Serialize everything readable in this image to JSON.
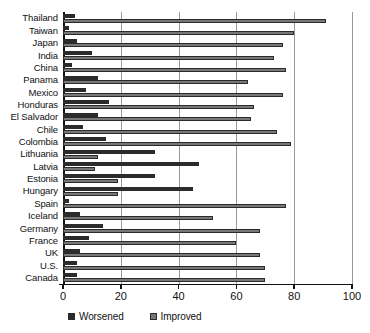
{
  "chart_data": {
    "type": "bar",
    "orientation": "horizontal",
    "title": "",
    "subtitle": "",
    "xlabel": "",
    "ylabel": "",
    "xlim": [
      0,
      100
    ],
    "xticks": [
      0,
      20,
      40,
      60,
      80,
      100
    ],
    "xtick_labels": [
      "0",
      "20",
      "40",
      "60",
      "80",
      "100"
    ],
    "grid": true,
    "grid_axis": "x",
    "legend_position": "bottom-left",
    "categories": [
      "Thailand",
      "Taiwan",
      "Japan",
      "India",
      "China",
      "Panama",
      "Mexico",
      "Honduras",
      "El Salvador",
      "Chile",
      "Colombia",
      "Lithuania",
      "Latvia",
      "Estonia",
      "Hungary",
      "Spain",
      "Iceland",
      "Germany",
      "France",
      "UK",
      "U.S.",
      "Canada"
    ],
    "series": [
      {
        "name": "Worsened",
        "color": "#2b2b2b",
        "values": [
          4,
          2,
          5,
          10,
          3,
          12,
          8,
          16,
          12,
          7,
          15,
          32,
          47,
          32,
          45,
          2,
          6,
          14,
          9,
          6,
          5,
          5
        ]
      },
      {
        "name": "Improved",
        "color": "#777777",
        "values": [
          91,
          80,
          76,
          73,
          77,
          64,
          76,
          66,
          65,
          74,
          79,
          12,
          11,
          19,
          19,
          77,
          52,
          68,
          60,
          68,
          70,
          70
        ]
      }
    ]
  },
  "legend": {
    "items": [
      {
        "label": "Worsened",
        "swatch": "worsened-swatch"
      },
      {
        "label": "Improved",
        "swatch": "improved-swatch"
      }
    ]
  },
  "colors": {
    "worsened": "#2b2b2b",
    "improved": "#777777",
    "axis": "#111111",
    "gridline": "#9a9a9a",
    "background": "#ffffff"
  }
}
